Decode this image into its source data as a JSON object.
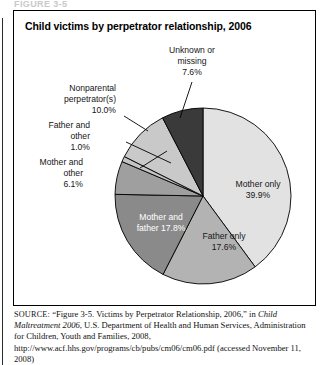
{
  "page": {
    "clipped_running_head": "FIGURE 3-5",
    "figure_title": "Child victims by perpetrator relationship, 2006"
  },
  "source": {
    "label": "SOURCE:",
    "line1": " “Figure 3-5. Victims by Perpetrator Relationship, 2006,” in ",
    "italic_title": "Child Maltreatment 2006",
    "line2": ", U.S. Department of Health and Human Services, Administration for Children, Youth and Families, 2008, http://www.acf.hhs.gov/programs/cb/pubs/cm06/cm06.pdf (accessed November 11, 2008)"
  },
  "chart_data": {
    "type": "pie",
    "title": "Child victims by perpetrator relationship, 2006",
    "xlabel": "",
    "ylabel": "",
    "units": "percent",
    "start_angle_deg": 0,
    "direction": "clockwise",
    "legend_position": "none",
    "grid": false,
    "categories": [
      "Mother only",
      "Father only",
      "Mother and father",
      "Mother and other",
      "Father and other",
      "Nonparental perpetrator(s)",
      "Unknown or missing"
    ],
    "values": [
      39.9,
      17.6,
      17.8,
      6.1,
      1.0,
      10.0,
      7.6
    ],
    "slices": [
      {
        "name": "Mother only",
        "label": "Mother only",
        "value": 39.9,
        "value_text": "39.9%",
        "color": "#e2e2e2",
        "label_placement": "inside",
        "label_color": "#161616"
      },
      {
        "name": "Father only",
        "label": "Father only",
        "value": 17.6,
        "value_text": "17.6%",
        "color": "#b3b3b3",
        "label_placement": "inside",
        "label_color": "#161616"
      },
      {
        "name": "Mother and father",
        "label": "Mother and father 17.8%",
        "value": 17.8,
        "value_text": "17.8%",
        "color": "#8a8a8a",
        "label_placement": "inside",
        "label_color": "#ffffff"
      },
      {
        "name": "Mother and other",
        "label": "Mother and other",
        "value": 6.1,
        "value_text": "6.1%",
        "color": "#9f9f9f",
        "label_placement": "outside-left",
        "label_color": "#161616"
      },
      {
        "name": "Father and other",
        "label": "Father and other",
        "value": 1.0,
        "value_text": "1.0%",
        "color": "#c4c4c4",
        "label_placement": "outside-left",
        "label_color": "#161616"
      },
      {
        "name": "Nonparental perpetrator(s)",
        "label": "Nonparental perpetrator(s)",
        "value": 10.0,
        "value_text": "10.0%",
        "color": "#c9c9c9",
        "label_placement": "outside-upper-left",
        "label_color": "#161616"
      },
      {
        "name": "Unknown or missing",
        "label": "Unknown or missing",
        "value": 7.6,
        "value_text": "7.6%",
        "color": "#3a3a3a",
        "label_placement": "outside-top",
        "label_color": "#161616"
      }
    ]
  },
  "labels": {
    "mother_only_name": "Mother only",
    "mother_only_pct": "39.9%",
    "father_only_name": "Father only",
    "father_only_pct": "17.6%",
    "mother_father_line": "Mother and",
    "mother_father_pct_line": "father 17.8%",
    "mother_other_l1": "Mother and",
    "mother_other_l2": "other",
    "mother_other_pct": "6.1%",
    "father_other_l1": "Father and",
    "father_other_l2": "other",
    "father_other_pct": "1.0%",
    "nonparental_l1": "Nonparental",
    "nonparental_l2": "perpetrator(s)",
    "nonparental_pct": "10.0%",
    "unknown_l1": "Unknown or",
    "unknown_l2": "missing",
    "unknown_pct": "7.6%"
  }
}
